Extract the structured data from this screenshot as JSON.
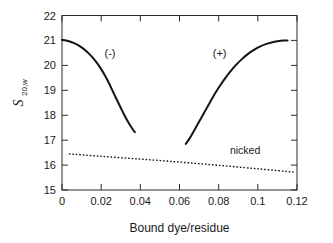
{
  "chart_data": {
    "type": "line",
    "title": "",
    "xlabel": "Bound dye/residue",
    "ylabel": "S",
    "ylabel_subscript": "20,w",
    "xlim": [
      0,
      0.12
    ],
    "ylim": [
      15,
      22
    ],
    "xticks": [
      0,
      0.02,
      0.04,
      0.06,
      0.08,
      0.1,
      0.12
    ],
    "xtick_labels": [
      "0",
      "0.02",
      "0.04",
      "0.06",
      "0.08",
      "0.1",
      "0.12"
    ],
    "yticks": [
      15,
      16,
      17,
      18,
      19,
      20,
      21,
      22
    ],
    "ytick_labels": [
      "15",
      "16",
      "17",
      "18",
      "19",
      "20",
      "21",
      "22"
    ],
    "grid": false,
    "legend": "none",
    "series": [
      {
        "name": "negative-supercoil-branch",
        "label": "(-)",
        "style": "solid",
        "color": "#141414",
        "annotation_at": {
          "x": 0.0245,
          "y": 20.35
        },
        "x": [
          0.0,
          0.002,
          0.004,
          0.006,
          0.008,
          0.01,
          0.012,
          0.014,
          0.016,
          0.018,
          0.02,
          0.022,
          0.024,
          0.026,
          0.028,
          0.03,
          0.032,
          0.034,
          0.036,
          0.0372
        ],
        "y": [
          21.02,
          21.0,
          20.96,
          20.9,
          20.82,
          20.72,
          20.6,
          20.45,
          20.28,
          20.08,
          19.85,
          19.58,
          19.28,
          18.95,
          18.62,
          18.3,
          17.98,
          17.7,
          17.45,
          17.32
        ]
      },
      {
        "name": "positive-supercoil-branch",
        "label": "(+)",
        "style": "solid",
        "color": "#141414",
        "annotation_at": {
          "x": 0.0805,
          "y": 20.35
        },
        "x": [
          0.0632,
          0.065,
          0.067,
          0.069,
          0.071,
          0.073,
          0.075,
          0.077,
          0.079,
          0.081,
          0.083,
          0.086,
          0.089,
          0.092,
          0.095,
          0.098,
          0.101,
          0.104,
          0.107,
          0.11,
          0.113,
          0.1152
        ],
        "y": [
          16.85,
          17.05,
          17.32,
          17.6,
          17.88,
          18.16,
          18.44,
          18.72,
          18.98,
          19.22,
          19.45,
          19.76,
          20.03,
          20.26,
          20.46,
          20.62,
          20.75,
          20.85,
          20.92,
          20.97,
          21.0,
          21.0
        ]
      },
      {
        "name": "nicked",
        "label": "nicked",
        "style": "dotted",
        "color": "#141414",
        "annotation_at": {
          "x": 0.0935,
          "y": 16.43
        },
        "x": [
          0.0035,
          0.02,
          0.04,
          0.06,
          0.08,
          0.1,
          0.1182
        ],
        "y": [
          16.45,
          16.35,
          16.24,
          16.12,
          15.99,
          15.85,
          15.72
        ]
      }
    ],
    "annotations": [
      {
        "name": "negative-branch-label",
        "text": "(-)",
        "x": 0.0245,
        "y": 20.35
      },
      {
        "name": "positive-branch-label",
        "text": "(+)",
        "x": 0.0805,
        "y": 20.35
      },
      {
        "name": "nicked-label",
        "text": "nicked",
        "x": 0.0935,
        "y": 16.43
      }
    ]
  },
  "axes": {
    "x_title": "Bound dye/residue",
    "y_title_base": "S",
    "y_title_sub": "20,w"
  },
  "ticks": {
    "x": [
      "0",
      "0.02",
      "0.04",
      "0.06",
      "0.08",
      "0.1",
      "0.12"
    ],
    "y": [
      "22",
      "21",
      "20",
      "19",
      "18",
      "17",
      "16",
      "15"
    ]
  }
}
